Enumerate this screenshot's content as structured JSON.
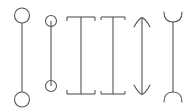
{
  "figure": {
    "width": 194,
    "height": 112,
    "background_color": "#ffffff",
    "stroke_color": "#555459",
    "stroke_width": 1.1
  },
  "samples": [
    {
      "index": 1,
      "name": "open-circle-terminator",
      "label": "Open circle",
      "shaft_x": 22,
      "shaft_top": 23,
      "shaft_bottom": 92,
      "cap_radius": 7.5,
      "top_center_y": 15.5,
      "bottom_center_y": 99.5
    },
    {
      "index": 2,
      "name": "divided-circle-terminator",
      "label": "Divided circle",
      "shaft_x": 51,
      "shaft_top": 27,
      "shaft_bottom": 80,
      "cap_radius": 5.5,
      "top_center_y": 21,
      "bottom_center_y": 86
    },
    {
      "index": 3,
      "name": "wide-bracket-terminator",
      "label": "Wide bracket",
      "shaft_x": 81,
      "shaft_top": 17,
      "shaft_bottom": 94,
      "bar_half_width": 14,
      "tick_length": 4,
      "top_bar_y": 17,
      "bottom_bar_y": 94
    },
    {
      "index": 4,
      "name": "narrow-bracket-terminator",
      "label": "Narrow bracket",
      "shaft_x": 113,
      "shaft_top": 17,
      "shaft_bottom": 94,
      "bar_half_width": 12,
      "tick_length": 3,
      "top_bar_y": 17,
      "bottom_bar_y": 94
    },
    {
      "index": 5,
      "name": "curved-arrow-terminator",
      "label": "Curved arrow",
      "shaft_x": 142,
      "shaft_top": 18,
      "shaft_bottom": 94,
      "barb_half_width": 8,
      "barb_depth": 9
    },
    {
      "index": 6,
      "name": "cup-arc-terminator",
      "label": "Cup arc",
      "shaft_x": 173,
      "shaft_top": 22,
      "shaft_bottom": 92,
      "arc_half_width": 9,
      "arc_depth": 10
    }
  ]
}
